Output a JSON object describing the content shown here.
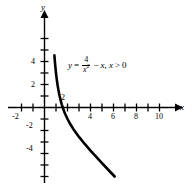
{
  "chart_data": {
    "type": "line",
    "title": "",
    "equation_text": "y = 4/x^2 - x, x > 0",
    "equation": {
      "lhs": "y",
      "equals": "=",
      "numerator": "4",
      "denominator": "x",
      "denominator_exponent": "2",
      "minus": "−",
      "term2": "x",
      "comma": ",",
      "domain_var": "x",
      "domain_op": ">",
      "domain_value": "0"
    },
    "xlabel": "x",
    "ylabel": "y",
    "xlim": [
      -3,
      11.6
    ],
    "ylim": [
      -6.6,
      6.3
    ],
    "x_tick_values": [
      -2,
      -1,
      1,
      2,
      3,
      4,
      5,
      6,
      7,
      8,
      9,
      10,
      11
    ],
    "x_tick_labels": [
      "-2",
      "4",
      "6",
      "8",
      "10"
    ],
    "x_labeled_ticks": [
      -2,
      4,
      6,
      8,
      10
    ],
    "y_tick_values": [
      -6,
      -5,
      -4,
      -3,
      -2,
      -1,
      1,
      2,
      3,
      4,
      5,
      6
    ],
    "y_tick_labels": [
      "4",
      "2",
      "-2",
      "-4"
    ],
    "y_labeled_ticks": [
      4,
      2,
      -2,
      -4
    ],
    "intercept_label": "2",
    "intercept_x": 1.587,
    "grid": false,
    "legend": "none",
    "curve_x_start": 0.86,
    "curve_x_end": 6.1,
    "points": [
      {
        "x": 0.86,
        "y": 4.55
      },
      {
        "x": 0.9,
        "y": 4.04
      },
      {
        "x": 0.95,
        "y": 3.48
      },
      {
        "x": 1.0,
        "y": 3.0
      },
      {
        "x": 1.05,
        "y": 2.58
      },
      {
        "x": 1.1,
        "y": 2.21
      },
      {
        "x": 1.15,
        "y": 1.87
      },
      {
        "x": 1.2,
        "y": 1.58
      },
      {
        "x": 1.3,
        "y": 1.07
      },
      {
        "x": 1.4,
        "y": 0.64
      },
      {
        "x": 1.5,
        "y": 0.28
      },
      {
        "x": 1.587,
        "y": 0.0
      },
      {
        "x": 1.7,
        "y": -0.32
      },
      {
        "x": 1.8,
        "y": -0.57
      },
      {
        "x": 2.0,
        "y": -1.0
      },
      {
        "x": 2.25,
        "y": -1.46
      },
      {
        "x": 2.5,
        "y": -1.86
      },
      {
        "x": 2.75,
        "y": -2.22
      },
      {
        "x": 3.0,
        "y": -2.56
      },
      {
        "x": 3.5,
        "y": -3.17
      },
      {
        "x": 4.0,
        "y": -3.75
      },
      {
        "x": 4.5,
        "y": -4.3
      },
      {
        "x": 5.0,
        "y": -4.84
      },
      {
        "x": 5.5,
        "y": -5.37
      },
      {
        "x": 6.1,
        "y": -6.0
      }
    ]
  },
  "axes": {
    "y_axis_name": "y",
    "x_axis_name": "x"
  }
}
